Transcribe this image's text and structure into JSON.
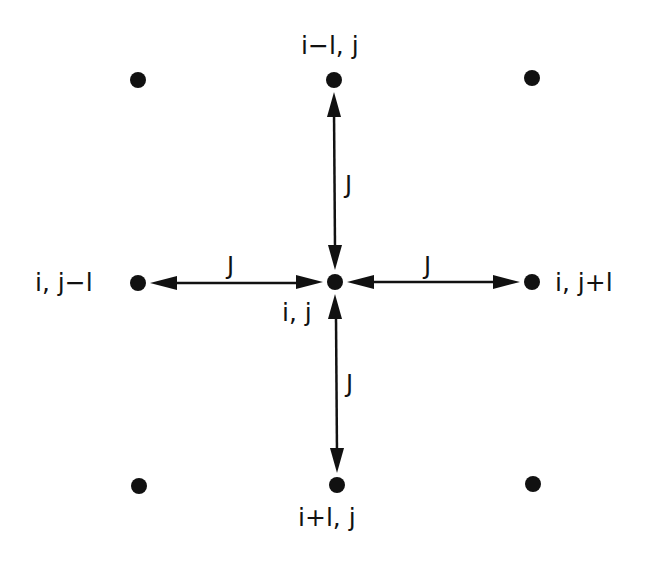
{
  "diagram": {
    "type": "lattice-neighbor-coupling",
    "colors": {
      "ink": "#111111",
      "background": "#ffffff"
    },
    "nodes": {
      "center": {
        "label": "i, j",
        "x": 335,
        "y": 282
      },
      "up": {
        "label": "i−l, j",
        "x": 334,
        "y": 80
      },
      "down": {
        "label": "i+l, j",
        "x": 337,
        "y": 485
      },
      "left": {
        "label": "i, j−l",
        "x": 138,
        "y": 283
      },
      "right": {
        "label": "i, j+l",
        "x": 532,
        "y": 282
      },
      "corner_tl": {
        "x": 138,
        "y": 80
      },
      "corner_tr": {
        "x": 532,
        "y": 78
      },
      "corner_bl": {
        "x": 139,
        "y": 486
      },
      "corner_br": {
        "x": 533,
        "y": 484
      }
    },
    "couplings": {
      "up": "J",
      "down": "J",
      "left": "J",
      "right": "J"
    }
  }
}
